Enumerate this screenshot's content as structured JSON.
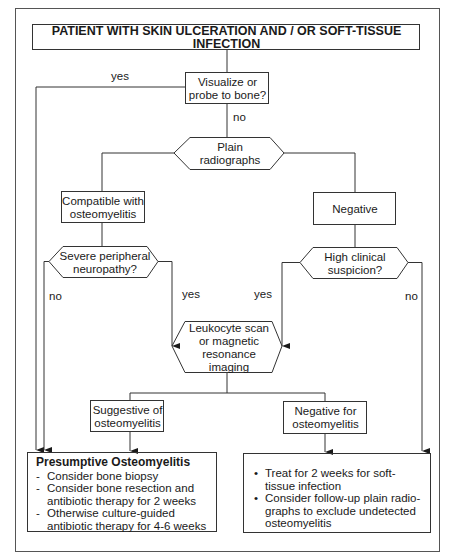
{
  "title": "PATIENT WITH SKIN ULCERATION AND / OR SOFT-TISSUE INFECTION",
  "nodes": {
    "visualize": "Visualize or probe to bone?",
    "plain": "Plain radiographs",
    "compatible": "Compatible with osteomyelitis",
    "negative": "Negative",
    "neuropathy": "Severe peripheral neuropathy?",
    "suspicion": "High clinical suspicion?",
    "leukocyte": "Leukocyte scan or magnetic resonance imaging",
    "suggestive": "Suggestive of osteomyelitis",
    "negative_for": "Negative for osteomyelitis"
  },
  "edges": {
    "visualize_yes": "yes",
    "visualize_no": "no",
    "neuropathy_no": "no",
    "neuropathy_yes": "yes",
    "suspicion_yes": "yes",
    "suspicion_no": "no"
  },
  "outcome_left": {
    "heading": "Presumptive Osteomyelitis",
    "marker": "-",
    "items": [
      "Consider bone biopsy",
      "Consider bone resection and antibiotic therapy for 2 weeks",
      "Otherwise culture-guided antibiotic therapy for 4-6 weeks"
    ]
  },
  "outcome_right": {
    "marker": "•",
    "items": [
      "Treat for 2 weeks for soft-tissue infection",
      "Consider follow-up plain radio-graphs to exclude undetected osteomyelitis"
    ]
  }
}
